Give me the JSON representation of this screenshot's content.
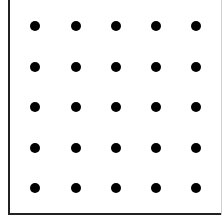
{
  "diagram": {
    "type": "dot-grid",
    "rows": 5,
    "columns": 5,
    "dot_color": "#000000",
    "border_color": "#222222",
    "column_centers_px": [
      35,
      76,
      116,
      156,
      196
    ],
    "row_centers_px": [
      26,
      67,
      107,
      148,
      188
    ],
    "dot_diameter_px": 10
  }
}
